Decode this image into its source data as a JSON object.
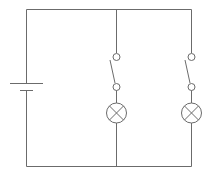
{
  "diagram": {
    "type": "circuit-schematic",
    "colors": {
      "wire": "#6b6b6b",
      "background": "#ffffff"
    },
    "components": [
      {
        "id": "battery",
        "kind": "battery"
      },
      {
        "id": "switch-1",
        "kind": "switch",
        "state": "open",
        "branch": 1
      },
      {
        "id": "lamp-1",
        "kind": "lamp",
        "branch": 1
      },
      {
        "id": "switch-2",
        "kind": "switch",
        "state": "open",
        "branch": 2
      },
      {
        "id": "lamp-2",
        "kind": "lamp",
        "branch": 2
      }
    ],
    "topology": "parallel"
  }
}
